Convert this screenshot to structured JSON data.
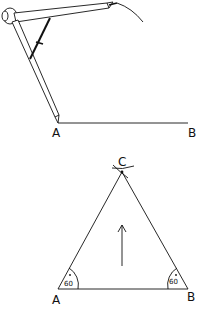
{
  "diagram": {
    "type": "geometric-construction",
    "step1": {
      "description": "Compass centred at A drawing an arc with radius AB",
      "labels": {
        "a": "A",
        "b": "B"
      }
    },
    "step2": {
      "description": "Equilateral triangle ABC",
      "labels": {
        "a": "A",
        "b": "B",
        "c": "C"
      },
      "angle_a": "60",
      "angle_b": "60"
    },
    "colors": {
      "ink": "#111111",
      "background": "#ffffff"
    }
  }
}
